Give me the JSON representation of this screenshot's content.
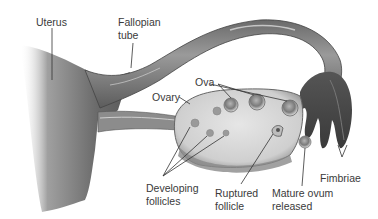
{
  "diagram": {
    "colors": {
      "tissue_dark": "#5a5a5a",
      "tissue_mid": "#8a8a8a",
      "ovary_fill": "#d8d8d8",
      "leader_line": "#333333",
      "label_text": "#3a3a3a",
      "background": "#ffffff"
    },
    "labels": {
      "uterus": "Uterus",
      "fallopian_tube_1": "Fallopian",
      "fallopian_tube_2": "tube",
      "ova": "Ova",
      "ovary": "Ovary",
      "fimbriae": "Fimbriae",
      "developing_follicles_1": "Developing",
      "developing_follicles_2": "follicles",
      "ruptured_follicle_1": "Ruptured",
      "ruptured_follicle_2": "follicle",
      "mature_ovum_1": "Mature ovum",
      "mature_ovum_2": "released"
    }
  }
}
